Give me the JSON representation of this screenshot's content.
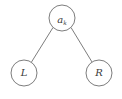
{
  "diagram": {
    "type": "binary-tree",
    "nodes": [
      {
        "id": "root",
        "label": "a",
        "subscript": "k",
        "cx": 62,
        "cy": 18,
        "r": 13
      },
      {
        "id": "left",
        "label": "L",
        "subscript": "",
        "cx": 24,
        "cy": 73,
        "r": 13
      },
      {
        "id": "right",
        "label": "R",
        "subscript": "",
        "cx": 99,
        "cy": 73,
        "r": 13
      }
    ],
    "edges": [
      {
        "from": "root",
        "to": "left"
      },
      {
        "from": "root",
        "to": "right"
      }
    ],
    "colors": {
      "stroke": "#6e6e6e",
      "text": "#3a3a3a",
      "background": "#ffffff"
    }
  }
}
